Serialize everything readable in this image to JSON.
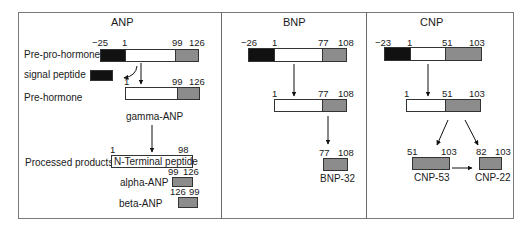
{
  "panels": {
    "anp": {
      "title": "ANP",
      "row_labels": {
        "pre_pro": "Pre-pro-hormone",
        "signal": "signal peptide",
        "pre": "Pre-hormone",
        "processed": "Processed products"
      },
      "pre_pro_nums": [
        "−25",
        "1",
        "99",
        "126"
      ],
      "pre_nums": [
        "1",
        "99",
        "126"
      ],
      "gamma_label": "gamma-ANP",
      "nterm": {
        "start": "1",
        "end": "98",
        "label": "N-Terminal peptide"
      },
      "alpha": {
        "label": "alpha-ANP",
        "start": "99",
        "end": "126"
      },
      "beta": {
        "label": "beta-ANP",
        "start": "126",
        "end": "99"
      }
    },
    "bnp": {
      "title": "BNP",
      "pre_pro_nums": [
        "−26",
        "1",
        "77",
        "108"
      ],
      "pre_nums": [
        "1",
        "77",
        "108"
      ],
      "product": {
        "label": "BNP-32",
        "start": "77",
        "end": "108"
      }
    },
    "cnp": {
      "title": "CNP",
      "pre_pro_nums": [
        "−23",
        "1",
        "51",
        "103"
      ],
      "pre_nums": [
        "1",
        "51",
        "103"
      ],
      "cnp53": {
        "label": "CNP-53",
        "start": "51",
        "end": "103"
      },
      "cnp22": {
        "label": "CNP-22",
        "start": "82",
        "end": "103"
      }
    }
  },
  "colors": {
    "signal": "#111111",
    "prohormone": "#ffffff",
    "mature": "#8c8c8c"
  }
}
